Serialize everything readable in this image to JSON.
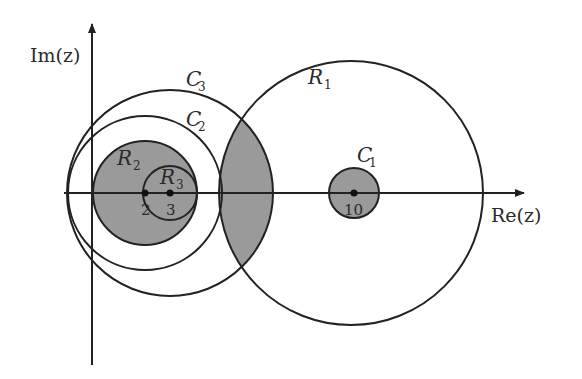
{
  "axes": {
    "x_label": "Re(z)",
    "y_label": "Im(z)"
  },
  "points": [
    {
      "label": "2",
      "value": 2
    },
    {
      "label": "3",
      "value": 3
    },
    {
      "label": "10",
      "value": 10
    }
  ],
  "regions": {
    "R1": {
      "name": "R",
      "sub": "1"
    },
    "R2": {
      "name": "R",
      "sub": "2"
    },
    "R3": {
      "name": "R",
      "sub": "3"
    }
  },
  "contours": {
    "C1": {
      "name": "C",
      "sub": "1"
    },
    "C2": {
      "name": "C",
      "sub": "2"
    },
    "C3": {
      "name": "C",
      "sub": "3"
    }
  },
  "colors": {
    "shade": "#9a9a9a",
    "stroke": "#222222",
    "background": "#ffffff"
  }
}
